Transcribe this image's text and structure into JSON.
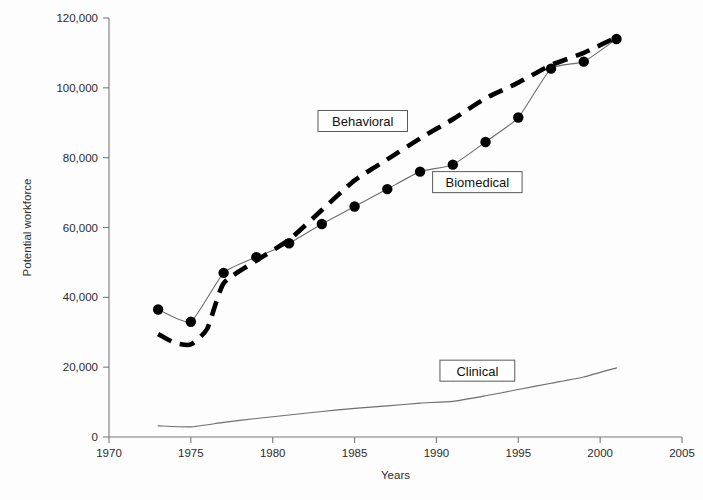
{
  "chart_data": {
    "type": "line",
    "title": "",
    "xlabel": "Years",
    "ylabel": "Potential workforce",
    "xlim": [
      1970,
      2005
    ],
    "ylim": [
      0,
      120000
    ],
    "grid": false,
    "legend_position": "inline-labels",
    "x_ticks": [
      "1970",
      "1975",
      "1980",
      "1985",
      "1990",
      "1995",
      "2000",
      "2005"
    ],
    "x_tick_values": [
      1970,
      1975,
      1980,
      1985,
      1990,
      1995,
      2000,
      2005
    ],
    "y_ticks": [
      "0",
      "20,000",
      "40,000",
      "60,000",
      "80,000",
      "100,000",
      "120,000"
    ],
    "y_tick_values": [
      0,
      20000,
      40000,
      60000,
      80000,
      100000,
      120000
    ],
    "series": [
      {
        "name": "Biomedical",
        "style": "solid-with-markers",
        "markers": true,
        "color": "#000000",
        "x": [
          1973,
          1975,
          1977,
          1979,
          1981,
          1983,
          1985,
          1987,
          1989,
          1991,
          1993,
          1995,
          1997,
          1999,
          2001
        ],
        "values": [
          36500,
          33000,
          47000,
          51500,
          55500,
          61000,
          66000,
          71000,
          76000,
          78000,
          84500,
          91500,
          105500,
          107500,
          114000
        ]
      },
      {
        "name": "Behavioral",
        "style": "dashed",
        "markers": false,
        "color": "#000000",
        "x": [
          1973,
          1974,
          1975,
          1976,
          1977,
          1979,
          1981,
          1983,
          1985,
          1987,
          1989,
          1991,
          1993,
          1995,
          1997,
          1999,
          2001
        ],
        "values": [
          29500,
          27000,
          26500,
          31000,
          44000,
          50500,
          56500,
          65000,
          73500,
          79500,
          85500,
          91000,
          97000,
          101500,
          106500,
          110000,
          114500
        ]
      },
      {
        "name": "Clinical",
        "style": "solid",
        "markers": false,
        "color": "#6e6e6e",
        "x": [
          1973,
          1975,
          1977,
          1979,
          1981,
          1983,
          1985,
          1987,
          1989,
          1991,
          1993,
          1995,
          1997,
          1999,
          2001
        ],
        "values": [
          3200,
          2900,
          4200,
          5300,
          6300,
          7300,
          8200,
          8900,
          9700,
          10200,
          11800,
          13600,
          15400,
          17200,
          19800
        ]
      }
    ],
    "annotations": [
      {
        "text": "Behavioral",
        "x": 1985.5,
        "y": 90500
      },
      {
        "text": "Biomedical",
        "x": 1992.5,
        "y": 73000
      },
      {
        "text": "Clinical",
        "x": 1992.5,
        "y": 19000
      }
    ]
  }
}
